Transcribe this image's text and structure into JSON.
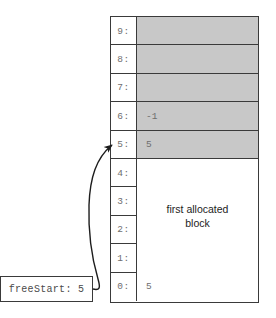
{
  "diagram": {
    "colors": {
      "shaded_cell": "#c8c8c8",
      "plain_cell": "#ffffff",
      "border": "#3a3a3a",
      "text_gray": "#6e6e6e",
      "text_dark": "#1d1d1d"
    }
  },
  "memory_array": {
    "name": "memory-array",
    "rows": [
      {
        "index_label": "9:",
        "value": "",
        "shaded": true
      },
      {
        "index_label": "8:",
        "value": "",
        "shaded": true
      },
      {
        "index_label": "7:",
        "value": "",
        "shaded": true
      },
      {
        "index_label": "6:",
        "value": "-1",
        "shaded": true
      },
      {
        "index_label": "5:",
        "value": "5",
        "shaded": true
      },
      {
        "index_label": "4:",
        "value": "",
        "shaded": false
      },
      {
        "index_label": "3:",
        "value": "",
        "shaded": false
      },
      {
        "index_label": "2:",
        "value": "",
        "shaded": false
      },
      {
        "index_label": "1:",
        "value": "",
        "shaded": false
      },
      {
        "index_label": "0:",
        "value": "5",
        "shaded": false
      }
    ]
  },
  "allocated_block": {
    "line1": "first allocated",
    "line2": "block",
    "spans_rows": "1-4"
  },
  "free_start": {
    "label": "freeStart: 5",
    "variable": "freeStart",
    "value": "5",
    "points_to_row": "5:"
  },
  "arrow": {
    "name": "free-start-pointer-arrow",
    "from": "freeStart box",
    "to": "row 5"
  }
}
